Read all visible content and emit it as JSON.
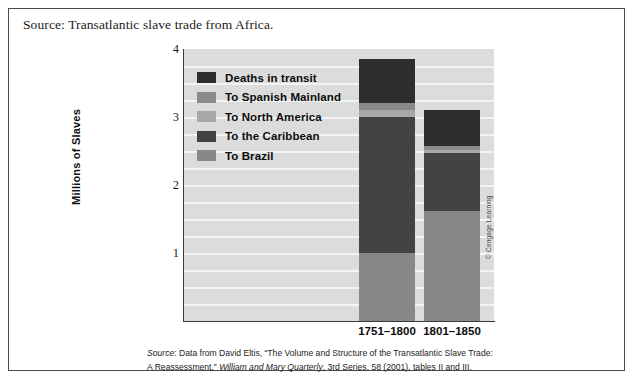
{
  "caption": "Source: Transatlantic slave trade from Africa.",
  "copyright": "© Cengage Learning",
  "footnote": {
    "lead": "Source",
    "line1_a": ": Data from David Eltis, “The Volume and Structure of the Transatlantic Slave Trade:",
    "line2_a": "A Reassessment,” ",
    "line2_italic": "William and Mary Quarterly",
    "line2_b": ", 3rd Series, 58 (2001), tables II and III."
  },
  "colors": {
    "plot_background": "#dcdcdc",
    "gridline": "#f4f4f4",
    "axis": "#3a3a3a",
    "deaths_in_transit": "#2e2e2e",
    "to_spanish_mainland": "#8a8a8a",
    "to_north_america": "#a8a8a8",
    "to_the_caribbean": "#434343",
    "to_brazil": "#888888"
  },
  "chart_data": {
    "type": "bar",
    "subtype": "stacked",
    "title": "Source: Transatlantic slave trade from Africa.",
    "xlabel": "",
    "ylabel": "Millions of Slaves",
    "ylim": [
      0,
      4
    ],
    "yticks": [
      1,
      2,
      3,
      4
    ],
    "ytick_labels": [
      "1",
      "2",
      "3",
      "4"
    ],
    "grid": true,
    "grid_interval": 0.25,
    "legend_position": "upper-left-inside",
    "categories": [
      "1751–1800",
      "1801–1850"
    ],
    "series": [
      {
        "name": "To Brazil",
        "color": "#888888",
        "values": [
          1.0,
          1.62
        ]
      },
      {
        "name": "To the Caribbean",
        "color": "#434343",
        "values": [
          2.0,
          0.85
        ]
      },
      {
        "name": "To North America",
        "color": "#a8a8a8",
        "values": [
          0.1,
          0.05
        ]
      },
      {
        "name": "To Spanish Mainland",
        "color": "#8a8a8a",
        "values": [
          0.1,
          0.05
        ]
      },
      {
        "name": "Deaths in transit",
        "color": "#2e2e2e",
        "values": [
          0.65,
          0.53
        ]
      }
    ],
    "totals": [
      3.85,
      3.1
    ]
  },
  "legend": {
    "items": [
      {
        "label": "Deaths in transit",
        "color": "#2e2e2e"
      },
      {
        "label": "To Spanish Mainland",
        "color": "#8a8a8a"
      },
      {
        "label": "To North America",
        "color": "#a8a8a8"
      },
      {
        "label": "To the Caribbean",
        "color": "#434343"
      },
      {
        "label": "To Brazil",
        "color": "#888888"
      }
    ]
  },
  "axis": {
    "y_title": "Millions of Slaves",
    "y_labels": [
      "4",
      "3",
      "2",
      "1"
    ],
    "x_labels": [
      "1751–1800",
      "1801–1850"
    ]
  }
}
